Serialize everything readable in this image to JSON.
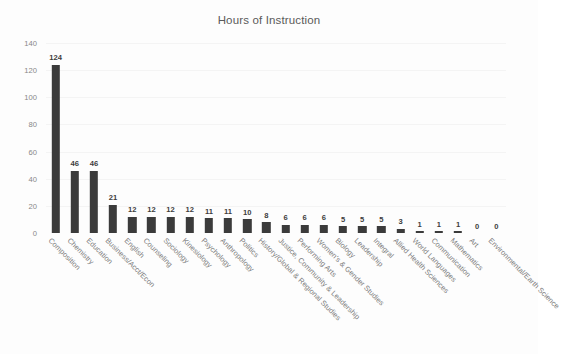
{
  "chart_data": {
    "type": "bar",
    "title": "Hours of Instruction",
    "xlabel": "",
    "ylabel": "",
    "ylim": [
      0,
      140
    ],
    "yticks": [
      0,
      20,
      40,
      60,
      80,
      100,
      120,
      140
    ],
    "grid": true,
    "legend": false,
    "orientation": "vertical",
    "bar_color": "#3b3b3b",
    "background_color": "#fdfdfd",
    "data_labels": true,
    "categories": [
      "Composition",
      "Chemistry",
      "Education",
      "Business/Acct/Econ",
      "English",
      "Counseling",
      "Sociology",
      "Kinesiology",
      "Psychology",
      "Anthropology",
      "Politics",
      "History/Global & Regional Studies",
      "Justice, Community & Leadership",
      "Performing Arts",
      "Women's & Gender Studies",
      "Biology",
      "Leadership",
      "Integral",
      "Allied Health Sciences",
      "World Languages",
      "Communication",
      "Mathematics",
      "Art",
      "Environmental/Earth Science"
    ],
    "values": [
      124,
      46,
      46,
      21,
      12,
      12,
      12,
      12,
      11,
      11,
      10,
      8,
      6,
      6,
      6,
      5,
      5,
      5,
      3,
      1,
      1,
      1,
      0,
      0
    ]
  }
}
